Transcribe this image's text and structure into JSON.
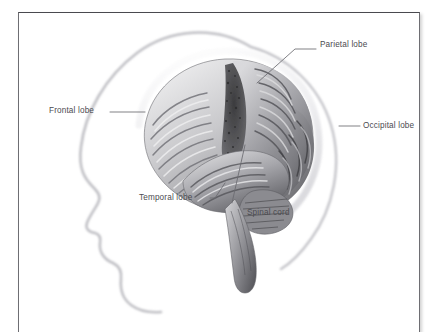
{
  "figure": {
    "background_color": "#ffffff",
    "frame_border_color": "#6e6e73",
    "label_text_color": "#4b4b50",
    "leader_line_color": "#6a6a70",
    "brain_tone_dark": "#4a4a4c",
    "brain_tone_mid": "#8d8d90",
    "brain_tone_light": "#e4e4e6",
    "head_outline_color": "#b9b9bd"
  },
  "labels": [
    {
      "id": "parietal-lobe",
      "text": "Parietal lobe",
      "text_x": 301,
      "text_y": 28,
      "leader": "M 238,70 L 276,36 L 297,36"
    },
    {
      "id": "frontal-lobe",
      "text": "Frontal lobe",
      "text_x": 30,
      "text_y": 94,
      "leader": "M 126,99 L 91,99"
    },
    {
      "id": "occipital-lobe",
      "text": "Occipital lobe",
      "text_x": 344,
      "text_y": 109,
      "leader": "M 320,113 L 341,113"
    },
    {
      "id": "temporal-lobe",
      "text": "Temporal lobe",
      "text_x": 120,
      "text_y": 181,
      "leader": "M 206,170 L 196,185 L 191,185"
    },
    {
      "id": "spinal-cord",
      "text": "Spinal cord",
      "text_x": 228,
      "text_y": 196,
      "leader": "M 226,132 L 213,190"
    }
  ],
  "anatomy_parts": [
    "head-profile-silhouette",
    "skull-outline",
    "cerebrum",
    "frontal-lobe-region",
    "parietal-lobe-region",
    "occipital-lobe-region",
    "temporal-lobe-region",
    "central-sulcus-band",
    "cerebellum",
    "brainstem-spinal-cord"
  ]
}
